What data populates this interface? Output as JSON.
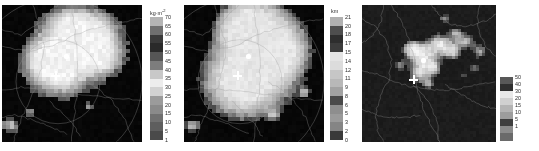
{
  "figure": {
    "type": "multi-panel-raster-map",
    "panel_count": 3,
    "background": "#ffffff",
    "colormap": "grayscale-discrete"
  },
  "chart_data": [
    {
      "type": "heatmap",
      "panel_index": 0,
      "title": "",
      "xlabel": "",
      "ylabel": "",
      "unit_label": "kg·m",
      "unit_exponent": "-2",
      "colorbar_position": "right",
      "grid": false,
      "legend_position": "right",
      "tick_labels": [
        "70",
        "65",
        "60",
        "55",
        "50",
        "45",
        "40",
        "35",
        "30",
        "25",
        "20",
        "15",
        "10",
        "5",
        "1"
      ],
      "tick_values": [
        70,
        65,
        60,
        55,
        50,
        45,
        40,
        35,
        30,
        25,
        20,
        15,
        10,
        5,
        1
      ],
      "band_colors": [
        "#b4b4b4",
        "#6f6f6f",
        "#3a3a3a",
        "#2a2a2a",
        "#565656",
        "#7d7d7d",
        "#c8c8c8",
        "#ededed",
        "#d2d2d2",
        "#9b9b9b",
        "#8a8a8a",
        "#707070",
        "#5e5e5e",
        "#4a4a4a"
      ],
      "background_value": "no-data",
      "background_color": "#050505",
      "markers": [
        {
          "name": "station-dot",
          "shape": "dot",
          "x_pct": 46,
          "y_pct": 37
        },
        {
          "name": "station-cross",
          "shape": "cross",
          "x_pct": 38,
          "y_pct": 51
        }
      ]
    },
    {
      "type": "heatmap",
      "panel_index": 1,
      "title": "",
      "xlabel": "",
      "ylabel": "",
      "unit_label": "km",
      "unit_exponent": "",
      "colorbar_position": "right",
      "grid": false,
      "legend_position": "right",
      "tick_labels": [
        "21",
        "20",
        "18",
        "17",
        "15",
        "14",
        "12",
        "11",
        "9",
        "8",
        "6",
        "5",
        "3",
        "2",
        "0"
      ],
      "tick_values": [
        21,
        20,
        18,
        17,
        15,
        14,
        12,
        11,
        9,
        8,
        6,
        5,
        3,
        2,
        0
      ],
      "band_colors": [
        "#b0b0b0",
        "#4e4e4e",
        "#2e2e2e",
        "#3c3c3c",
        "#e4e4e4",
        "#dcdcdc",
        "#c6c6c6",
        "#b8b8b8",
        "#a2a2a2",
        "#4a4a4a",
        "#8e8e8e",
        "#9a9a9a",
        "#858585",
        "#3a3a3a"
      ],
      "background_value": "no-data",
      "background_color": "#050505",
      "markers": [
        {
          "name": "station-dot",
          "shape": "dot",
          "x_pct": 46,
          "y_pct": 37
        },
        {
          "name": "station-cross",
          "shape": "cross",
          "x_pct": 38,
          "y_pct": 51
        }
      ]
    },
    {
      "type": "heatmap",
      "panel_index": 2,
      "title": "",
      "xlabel": "",
      "ylabel": "",
      "unit_label": "",
      "unit_exponent": "",
      "colorbar_position": "right",
      "grid": false,
      "legend_position": "right",
      "tick_labels": [
        "50",
        "40",
        "30",
        "20",
        "15",
        "10",
        "5",
        "1"
      ],
      "tick_values": [
        50,
        40,
        30,
        20,
        15,
        10,
        5,
        1
      ],
      "band_colors": [
        "#585858",
        "#2f2f2f",
        "#e8e8e8",
        "#d0d0d0",
        "#b4b4b4",
        "#9d9d9d",
        "#3f3f3f",
        "#8b8b8b",
        "#6a6a6a"
      ],
      "background_value": "no-data",
      "background_color": "#1a1a1a",
      "markers": [
        {
          "name": "station-dot",
          "shape": "dot",
          "x_pct": 46,
          "y_pct": 40
        },
        {
          "name": "station-cross",
          "shape": "cross",
          "x_pct": 38,
          "y_pct": 54
        }
      ]
    }
  ],
  "panels": [
    {
      "name": "panel-left",
      "map_left": 2,
      "map_top": 5,
      "map_width": 140,
      "map_height": 137,
      "cbar_left": 150,
      "cbar_top": 17,
      "cbar_width": 13,
      "cbar_height": 123,
      "tick_left": 165,
      "unit_left": 150,
      "unit_top": 9
    },
    {
      "name": "panel-middle",
      "map_left": 184,
      "map_top": 5,
      "map_width": 140,
      "map_height": 137,
      "cbar_left": 330,
      "cbar_top": 17,
      "cbar_width": 13,
      "cbar_height": 123,
      "tick_left": 345,
      "unit_left": 331,
      "unit_top": 9
    },
    {
      "name": "panel-right",
      "map_left": 362,
      "map_top": 5,
      "map_width": 134,
      "map_height": 137,
      "cbar_left": 500,
      "cbar_top": 77,
      "cbar_width": 13,
      "cbar_height": 63,
      "tick_left": 515,
      "unit_left": 500,
      "unit_top": 70
    }
  ]
}
